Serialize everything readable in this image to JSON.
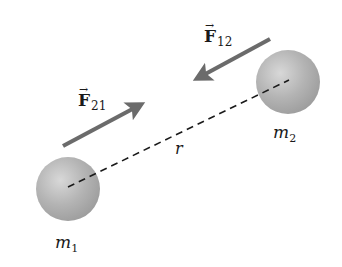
{
  "diagram": {
    "colors": {
      "background": "#ffffff",
      "arrow": "#6b6b6b",
      "sphere_base": "#a9a9a9",
      "sphere_highlight": "#d8d8d8",
      "dashed_line": "#1a1a1a",
      "text": "#1a1a1a"
    },
    "bodies": [
      {
        "id": "m1",
        "label_base": "m",
        "label_sub": "1",
        "cx": 68,
        "cy": 189,
        "r": 32
      },
      {
        "id": "m2",
        "label_base": "m",
        "label_sub": "2",
        "cx": 288,
        "cy": 82,
        "r": 32
      }
    ],
    "forces": [
      {
        "id": "F21",
        "label_base": "F",
        "label_sub": "21",
        "vector_mark": "→",
        "from": [
          63,
          146
        ],
        "to": [
          146,
          102
        ],
        "acts_on": "m1",
        "direction": "toward m2"
      },
      {
        "id": "F12",
        "label_base": "F",
        "label_sub": "12",
        "vector_mark": "→",
        "from": [
          270,
          39
        ],
        "to": [
          192,
          81
        ],
        "acts_on": "m2",
        "direction": "toward m1"
      }
    ],
    "separation": {
      "label": "r",
      "style": "dashed",
      "from": "m1",
      "to": "m2"
    }
  }
}
